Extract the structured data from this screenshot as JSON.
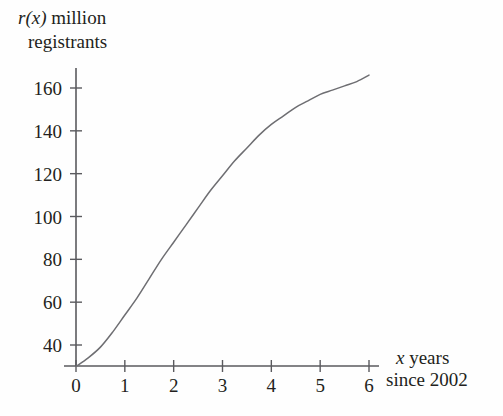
{
  "chart_data": {
    "type": "line",
    "title": "",
    "ylabel_line1_prefix": "r(x)",
    "ylabel_line1_rest": " million",
    "ylabel_line2": "registrants",
    "xlabel_line1_prefix": "x",
    "xlabel_line1_rest": " years",
    "xlabel_line2": "since 2002",
    "ylabel": "r(x) million registrants",
    "xlabel": "x years since 2002",
    "xticks": [
      "0",
      "1",
      "2",
      "3",
      "4",
      "5",
      "6"
    ],
    "xtick_values": [
      0,
      1,
      2,
      3,
      4,
      5,
      6
    ],
    "yticks": [
      "40",
      "60",
      "80",
      "100",
      "120",
      "140",
      "160"
    ],
    "ytick_values": [
      40,
      60,
      80,
      100,
      120,
      140,
      160
    ],
    "xlim": [
      0,
      6
    ],
    "ylim": [
      0,
      175
    ],
    "grid": false,
    "legend": null,
    "series": [
      {
        "name": "r(x)",
        "x": [
          0,
          0.25,
          0.5,
          0.75,
          1,
          1.25,
          1.5,
          1.75,
          2,
          2.25,
          2.5,
          2.75,
          3,
          3.25,
          3.5,
          3.75,
          4,
          4.25,
          4.5,
          4.75,
          5,
          5.25,
          5.5,
          5.75,
          6
        ],
        "values": [
          30,
          34,
          39,
          46,
          54,
          62,
          71,
          80,
          88,
          96,
          104,
          112,
          119,
          126,
          132,
          138,
          143,
          147,
          151,
          154,
          157,
          159,
          161,
          163,
          166
        ]
      }
    ],
    "curve_shape": "logistic-sigmoid",
    "line_color": "#6e6e72",
    "axis_color": "#5a5a5e",
    "background_color": "#fefefe"
  }
}
